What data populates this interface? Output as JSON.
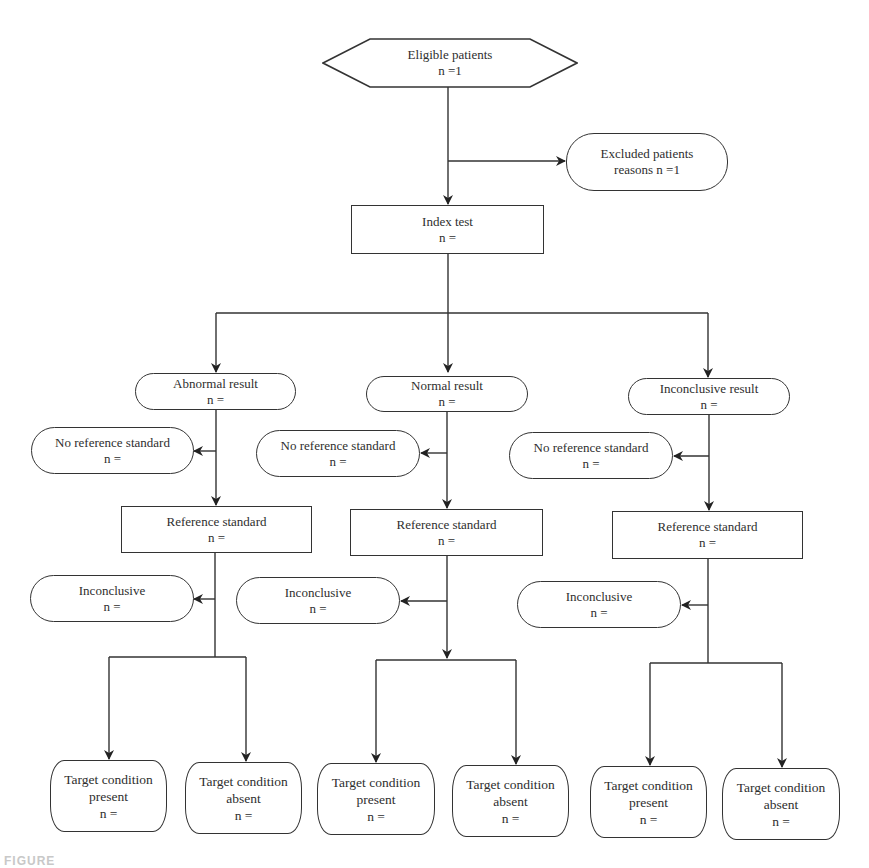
{
  "diagram": {
    "type": "flowchart",
    "eligible": {
      "label": "Eligible patients",
      "n": "n =1"
    },
    "excluded": {
      "label": "Excluded patients",
      "n": "reasons n =1"
    },
    "index_test": {
      "label": "Index test",
      "n": "n ="
    },
    "branches": [
      {
        "result": {
          "label": "Abnormal result",
          "n": "n ="
        },
        "no_reference": {
          "label": "No reference standard",
          "n": "n ="
        },
        "reference": {
          "label": "Reference standard",
          "n": "n ="
        },
        "inconclusive": {
          "label": "Inconclusive",
          "n": "n ="
        },
        "present": {
          "line1": "Target condition",
          "line2": "present",
          "n": "n ="
        },
        "absent": {
          "line1": "Target condition",
          "line2": "absent",
          "n": "n ="
        }
      },
      {
        "result": {
          "label": "Normal result",
          "n": "n ="
        },
        "no_reference": {
          "label": "No reference standard",
          "n": "n ="
        },
        "reference": {
          "label": "Reference standard",
          "n": "n ="
        },
        "inconclusive": {
          "label": "Inconclusive",
          "n": "n ="
        },
        "present": {
          "line1": "Target condition",
          "line2": "present",
          "n": "n ="
        },
        "absent": {
          "line1": "Target condition",
          "line2": "absent",
          "n": "n ="
        }
      },
      {
        "result": {
          "label": "Inconclusive result",
          "n": "n ="
        },
        "no_reference": {
          "label": "No reference standard",
          "n": "n ="
        },
        "reference": {
          "label": "Reference standard",
          "n": "n ="
        },
        "inconclusive": {
          "label": "Inconclusive",
          "n": "n ="
        },
        "present": {
          "line1": "Target condition",
          "line2": "present",
          "n": "n ="
        },
        "absent": {
          "line1": "Target condition",
          "line2": "absent",
          "n": "n ="
        }
      }
    ]
  },
  "caption": {
    "text": "FIGURE"
  },
  "colors": {
    "line": "#333333",
    "text": "#2e2e2e",
    "background": "#ffffff"
  }
}
